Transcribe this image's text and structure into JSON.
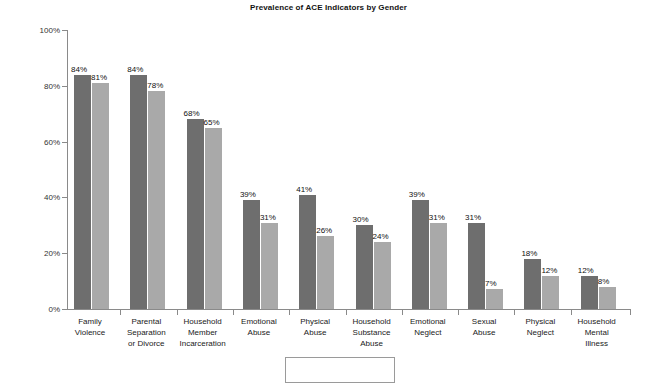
{
  "chart_data": {
    "type": "bar",
    "title": "Prevalence of ACE Indicators by Gender",
    "xlabel": "",
    "ylabel": "",
    "ylim": [
      0,
      100
    ],
    "grid": false,
    "legend_position": "bottom",
    "y_ticks": [
      "0%",
      "20%",
      "40%",
      "60%",
      "80%",
      "100%"
    ],
    "y_tick_values": [
      0,
      20,
      40,
      60,
      80,
      100
    ],
    "categories": [
      "Family Violence",
      "Parental Separation or Divorce",
      "Household Member Incarceration",
      "Emotional Abuse",
      "Physical Abuse",
      "Household Substance Abuse",
      "Emotional Neglect",
      "Sexual Abuse",
      "Physical Neglect",
      "Household Mental Illness"
    ],
    "category_lines": [
      [
        "Family",
        "Violence"
      ],
      [
        "Parental",
        "Separation",
        "or Divorce"
      ],
      [
        "Household",
        "Member",
        "Incarceration"
      ],
      [
        "Emotional",
        "Abuse"
      ],
      [
        "Physical",
        "Abuse"
      ],
      [
        "Household",
        "Substance",
        "Abuse"
      ],
      [
        "Emotional",
        "Neglect"
      ],
      [
        "Sexual",
        "Abuse"
      ],
      [
        "Physical",
        "Neglect"
      ],
      [
        "Household",
        "Mental",
        "Illness"
      ]
    ],
    "series": [
      {
        "name": "Series 1",
        "color": "#6e6e6e",
        "values": [
          84,
          84,
          68,
          39,
          41,
          30,
          39,
          31,
          18,
          12
        ],
        "labels": [
          "84%",
          "84%",
          "68%",
          "39%",
          "41%",
          "30%",
          "39%",
          "31%",
          "18%",
          "12%"
        ]
      },
      {
        "name": "Series 2",
        "color": "#a9a9a9",
        "values": [
          81,
          78,
          65,
          31,
          26,
          24,
          31,
          7,
          12,
          8
        ],
        "labels": [
          "81%",
          "78%",
          "65%",
          "31%",
          "26%",
          "24%",
          "31%",
          "7%",
          "12%",
          "8%"
        ]
      }
    ]
  },
  "legend": {
    "clipped": true,
    "entries": []
  }
}
